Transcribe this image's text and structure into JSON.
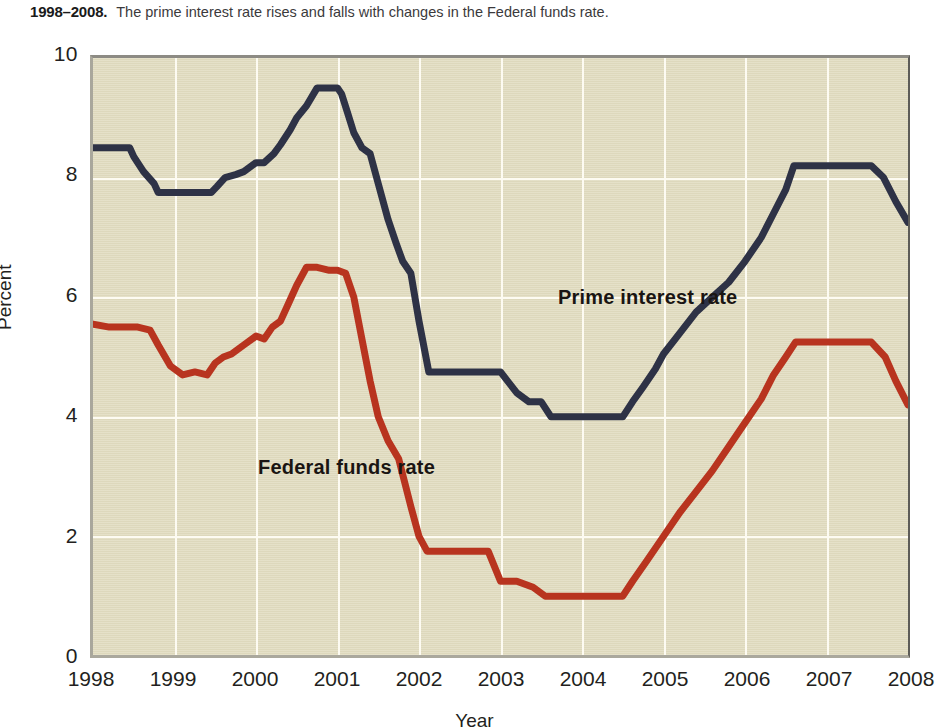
{
  "caption": {
    "years": "1998–2008.",
    "text": "The prime interest rate rises and falls with changes in the Federal funds rate."
  },
  "axes": {
    "ylabel": "Percent",
    "xlabel": "Year",
    "yticks": [
      "0",
      "2",
      "4",
      "6",
      "8",
      "10"
    ],
    "xticks": [
      "1998",
      "1999",
      "2000",
      "2001",
      "2002",
      "2003",
      "2004",
      "2005",
      "2006",
      "2007",
      "2008"
    ]
  },
  "annotations": {
    "prime": "Prime interest rate",
    "federal_funds": "Federal funds rate"
  },
  "colors": {
    "prime_line": "#2e3246",
    "federal_funds_line": "#b8341f",
    "plot_background": "#e2ddc2",
    "gridline": "#fdfbf2",
    "page_background": "#ffffff",
    "text": "#231f20"
  },
  "chart_data": {
    "type": "line",
    "title": "",
    "subtitle": "The prime interest rate rises and falls with changes in the Federal funds rate.",
    "xlabel": "Year",
    "ylabel": "Percent",
    "xlim": [
      1998,
      2008
    ],
    "ylim": [
      0,
      10
    ],
    "xticks": [
      1998,
      1999,
      2000,
      2001,
      2002,
      2003,
      2004,
      2005,
      2006,
      2007,
      2008
    ],
    "yticks": [
      0,
      2,
      4,
      6,
      8,
      10
    ],
    "grid": true,
    "legend": "inline-annotations",
    "series": [
      {
        "name": "Prime interest rate",
        "color": "#2e3246",
        "x": [
          1998.0,
          1998.45,
          1998.5,
          1998.62,
          1998.75,
          1998.8,
          1999.3,
          1999.45,
          1999.52,
          1999.62,
          1999.75,
          1999.85,
          2000.0,
          2000.1,
          2000.22,
          2000.3,
          2000.42,
          2000.5,
          2000.62,
          2000.75,
          2000.9,
          2001.0,
          2001.05,
          2001.12,
          2001.2,
          2001.3,
          2001.4,
          2001.5,
          2001.62,
          2001.72,
          2001.8,
          2001.9,
          2002.0,
          2002.12,
          2002.6,
          2002.72,
          2002.85,
          2003.0,
          2003.2,
          2003.35,
          2003.5,
          2003.62,
          2004.0,
          2004.35,
          2004.5,
          2004.62,
          2004.75,
          2004.9,
          2005.0,
          2005.2,
          2005.4,
          2005.6,
          2005.8,
          2006.0,
          2006.2,
          2006.35,
          2006.5,
          2006.6,
          2007.55,
          2007.7,
          2007.85,
          2008.0
        ],
        "y": [
          8.5,
          8.5,
          8.35,
          8.1,
          7.9,
          7.75,
          7.75,
          7.75,
          7.85,
          8.0,
          8.05,
          8.1,
          8.25,
          8.25,
          8.4,
          8.55,
          8.8,
          9.0,
          9.2,
          9.5,
          9.5,
          9.5,
          9.4,
          9.1,
          8.75,
          8.5,
          8.4,
          7.9,
          7.3,
          6.9,
          6.6,
          6.4,
          5.6,
          4.75,
          4.75,
          4.75,
          4.75,
          4.75,
          4.4,
          4.25,
          4.25,
          4.0,
          4.0,
          4.0,
          4.0,
          4.25,
          4.5,
          4.8,
          5.05,
          5.4,
          5.75,
          6.0,
          6.25,
          6.6,
          7.0,
          7.4,
          7.8,
          8.2,
          8.2,
          8.0,
          7.6,
          7.25
        ]
      },
      {
        "name": "Federal funds rate",
        "color": "#b8341f",
        "x": [
          1998.0,
          1998.2,
          1998.3,
          1998.45,
          1998.55,
          1998.7,
          1998.8,
          1998.95,
          1999.1,
          1999.25,
          1999.4,
          1999.5,
          1999.6,
          1999.7,
          1999.85,
          2000.0,
          2000.1,
          2000.2,
          2000.3,
          2000.4,
          2000.5,
          2000.62,
          2000.75,
          2000.9,
          2001.0,
          2001.1,
          2001.2,
          2001.3,
          2001.4,
          2001.5,
          2001.62,
          2001.75,
          2001.9,
          2002.0,
          2002.1,
          2002.55,
          2002.7,
          2002.85,
          2003.0,
          2003.2,
          2003.4,
          2003.55,
          2003.75,
          2004.0,
          2004.3,
          2004.5,
          2004.62,
          2004.8,
          2005.0,
          2005.2,
          2005.4,
          2005.6,
          2005.8,
          2006.0,
          2006.2,
          2006.35,
          2006.5,
          2006.62,
          2007.55,
          2007.72,
          2007.85,
          2008.0
        ],
        "y": [
          5.55,
          5.5,
          5.5,
          5.5,
          5.5,
          5.45,
          5.2,
          4.85,
          4.7,
          4.75,
          4.7,
          4.9,
          5.0,
          5.05,
          5.2,
          5.35,
          5.3,
          5.5,
          5.6,
          5.9,
          6.2,
          6.5,
          6.5,
          6.45,
          6.45,
          6.4,
          6.0,
          5.3,
          4.6,
          4.0,
          3.6,
          3.3,
          2.5,
          2.0,
          1.75,
          1.75,
          1.75,
          1.75,
          1.25,
          1.25,
          1.15,
          1.0,
          1.0,
          1.0,
          1.0,
          1.0,
          1.25,
          1.6,
          2.0,
          2.4,
          2.75,
          3.1,
          3.5,
          3.9,
          4.3,
          4.7,
          5.0,
          5.25,
          5.25,
          5.0,
          4.6,
          4.2
        ]
      }
    ]
  }
}
